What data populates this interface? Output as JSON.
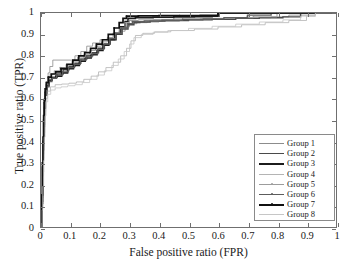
{
  "chart_data": {
    "type": "line",
    "title": "",
    "xlabel": "False positive ratio (FPR)",
    "ylabel": "True positive ratio (TPR)",
    "xlim": [
      0,
      1
    ],
    "ylim": [
      0,
      1
    ],
    "grid": false,
    "legend_position": "lower right",
    "xticks": [
      "0",
      "0.1",
      "0.2",
      "0.3",
      "0.4",
      "0.5",
      "0.6",
      "0.7",
      "0.8",
      "0.9",
      "1"
    ],
    "yticks": [
      "0",
      "0.1",
      "0.2",
      "0.3",
      "0.4",
      "0.5",
      "0.6",
      "0.7",
      "0.8",
      "0.9",
      "1"
    ],
    "xtick_values": [
      0,
      0.1,
      0.2,
      0.3,
      0.4,
      0.5,
      0.6,
      0.7,
      0.8,
      0.9,
      1
    ],
    "ytick_values": [
      0,
      0.1,
      0.2,
      0.3,
      0.4,
      0.5,
      0.6,
      0.7,
      0.8,
      0.9,
      1
    ],
    "series": [
      {
        "name": "Group 1",
        "color": "#8c8c8c",
        "width": 0.8,
        "marker": "none",
        "points": [
          [
            0,
            0
          ],
          [
            0.004,
            0.1
          ],
          [
            0.006,
            0.22
          ],
          [
            0.008,
            0.34
          ],
          [
            0.01,
            0.46
          ],
          [
            0.012,
            0.56
          ],
          [
            0.014,
            0.62
          ],
          [
            0.018,
            0.68
          ],
          [
            0.024,
            0.72
          ],
          [
            0.03,
            0.75
          ],
          [
            0.04,
            0.78
          ],
          [
            0.1,
            0.78
          ],
          [
            0.115,
            0.8
          ],
          [
            0.135,
            0.82
          ],
          [
            0.155,
            0.845
          ],
          [
            0.175,
            0.86
          ],
          [
            0.2,
            0.875
          ],
          [
            0.225,
            0.885
          ],
          [
            0.245,
            0.9
          ],
          [
            0.265,
            0.915
          ],
          [
            0.285,
            0.935
          ],
          [
            0.3,
            0.95
          ],
          [
            0.325,
            0.955
          ],
          [
            0.36,
            0.958
          ],
          [
            0.4,
            0.962
          ],
          [
            0.47,
            0.966
          ],
          [
            0.55,
            0.97
          ],
          [
            0.62,
            0.975
          ],
          [
            0.7,
            0.978
          ],
          [
            0.78,
            0.982
          ],
          [
            0.84,
            0.99
          ],
          [
            0.93,
            0.99
          ],
          [
            0.93,
            1.0
          ],
          [
            1.0,
            1.0
          ]
        ]
      },
      {
        "name": "Group 2",
        "color": "#4a4a4a",
        "width": 1.4,
        "marker": "none",
        "points": [
          [
            0,
            0
          ],
          [
            0.004,
            0.12
          ],
          [
            0.006,
            0.26
          ],
          [
            0.008,
            0.38
          ],
          [
            0.01,
            0.48
          ],
          [
            0.012,
            0.56
          ],
          [
            0.015,
            0.62
          ],
          [
            0.02,
            0.66
          ],
          [
            0.028,
            0.685
          ],
          [
            0.038,
            0.7
          ],
          [
            0.055,
            0.715
          ],
          [
            0.075,
            0.735
          ],
          [
            0.095,
            0.75
          ],
          [
            0.115,
            0.765
          ],
          [
            0.135,
            0.785
          ],
          [
            0.155,
            0.8
          ],
          [
            0.175,
            0.815
          ],
          [
            0.195,
            0.835
          ],
          [
            0.215,
            0.855
          ],
          [
            0.235,
            0.875
          ],
          [
            0.255,
            0.9
          ],
          [
            0.275,
            0.925
          ],
          [
            0.295,
            0.945
          ],
          [
            0.315,
            0.955
          ],
          [
            0.335,
            0.958
          ],
          [
            0.37,
            0.962
          ],
          [
            0.42,
            0.965
          ],
          [
            0.5,
            0.968
          ],
          [
            0.58,
            0.97
          ],
          [
            0.66,
            0.975
          ],
          [
            0.74,
            0.978
          ],
          [
            0.82,
            0.982
          ],
          [
            0.88,
            0.99
          ],
          [
            0.88,
            1.0
          ],
          [
            1.0,
            1.0
          ]
        ]
      },
      {
        "name": "Group 3",
        "color": "#1c1c1c",
        "width": 1.6,
        "marker": "none",
        "points": [
          [
            0,
            0
          ],
          [
            0.003,
            0.14
          ],
          [
            0.005,
            0.28
          ],
          [
            0.007,
            0.4
          ],
          [
            0.009,
            0.5
          ],
          [
            0.011,
            0.58
          ],
          [
            0.014,
            0.63
          ],
          [
            0.019,
            0.665
          ],
          [
            0.026,
            0.685
          ],
          [
            0.036,
            0.695
          ],
          [
            0.05,
            0.705
          ],
          [
            0.07,
            0.72
          ],
          [
            0.09,
            0.74
          ],
          [
            0.11,
            0.755
          ],
          [
            0.13,
            0.775
          ],
          [
            0.15,
            0.79
          ],
          [
            0.17,
            0.805
          ],
          [
            0.19,
            0.825
          ],
          [
            0.21,
            0.85
          ],
          [
            0.23,
            0.875
          ],
          [
            0.25,
            0.905
          ],
          [
            0.268,
            0.935
          ],
          [
            0.285,
            0.96
          ],
          [
            0.295,
            0.975
          ],
          [
            0.32,
            0.978
          ],
          [
            0.38,
            0.98
          ],
          [
            0.45,
            0.982
          ],
          [
            0.52,
            0.983
          ],
          [
            0.58,
            0.985
          ],
          [
            0.6,
            0.99
          ],
          [
            0.6,
            1.0
          ],
          [
            1.0,
            1.0
          ]
        ]
      },
      {
        "name": "Group 4",
        "color": "#b4b4b4",
        "width": 0.8,
        "marker": "none",
        "points": [
          [
            0,
            0
          ],
          [
            0.004,
            0.09
          ],
          [
            0.006,
            0.2
          ],
          [
            0.008,
            0.32
          ],
          [
            0.01,
            0.44
          ],
          [
            0.013,
            0.54
          ],
          [
            0.016,
            0.6
          ],
          [
            0.022,
            0.635
          ],
          [
            0.032,
            0.655
          ],
          [
            0.048,
            0.665
          ],
          [
            0.07,
            0.668
          ],
          [
            0.095,
            0.672
          ],
          [
            0.12,
            0.678
          ],
          [
            0.145,
            0.69
          ],
          [
            0.17,
            0.705
          ],
          [
            0.195,
            0.725
          ],
          [
            0.22,
            0.745
          ],
          [
            0.245,
            0.77
          ],
          [
            0.27,
            0.8
          ],
          [
            0.29,
            0.835
          ],
          [
            0.305,
            0.87
          ],
          [
            0.32,
            0.895
          ],
          [
            0.345,
            0.905
          ],
          [
            0.385,
            0.912
          ],
          [
            0.44,
            0.918
          ],
          [
            0.52,
            0.925
          ],
          [
            0.6,
            0.935
          ],
          [
            0.68,
            0.945
          ],
          [
            0.76,
            0.955
          ],
          [
            0.84,
            0.965
          ],
          [
            0.9,
            0.985
          ],
          [
            0.93,
            0.99
          ],
          [
            0.93,
            1.0
          ],
          [
            1.0,
            1.0
          ]
        ]
      },
      {
        "name": "Group 5",
        "color": "#9c9c9c",
        "width": 1.0,
        "marker": "dot",
        "points": [
          [
            0,
            0
          ],
          [
            0.003,
            0.13
          ],
          [
            0.005,
            0.27
          ],
          [
            0.007,
            0.39
          ],
          [
            0.009,
            0.49
          ],
          [
            0.011,
            0.57
          ],
          [
            0.013,
            0.625
          ],
          [
            0.017,
            0.665
          ],
          [
            0.023,
            0.695
          ],
          [
            0.031,
            0.715
          ],
          [
            0.045,
            0.73
          ],
          [
            0.065,
            0.745
          ],
          [
            0.085,
            0.76
          ],
          [
            0.105,
            0.775
          ],
          [
            0.125,
            0.79
          ],
          [
            0.145,
            0.805
          ],
          [
            0.165,
            0.825
          ],
          [
            0.185,
            0.845
          ],
          [
            0.205,
            0.865
          ],
          [
            0.225,
            0.885
          ],
          [
            0.245,
            0.905
          ],
          [
            0.265,
            0.93
          ],
          [
            0.285,
            0.955
          ],
          [
            0.3,
            0.965
          ],
          [
            0.33,
            0.968
          ],
          [
            0.38,
            0.97
          ],
          [
            0.45,
            0.972
          ],
          [
            0.54,
            0.975
          ],
          [
            0.63,
            0.978
          ],
          [
            0.72,
            0.982
          ],
          [
            0.8,
            0.99
          ],
          [
            0.8,
            1.0
          ],
          [
            1.0,
            1.0
          ]
        ]
      },
      {
        "name": "Group 6",
        "color": "#5c5c5c",
        "width": 1.3,
        "marker": "dot",
        "points": [
          [
            0,
            0
          ],
          [
            0.004,
            0.11
          ],
          [
            0.006,
            0.24
          ],
          [
            0.008,
            0.36
          ],
          [
            0.01,
            0.47
          ],
          [
            0.012,
            0.555
          ],
          [
            0.015,
            0.615
          ],
          [
            0.02,
            0.655
          ],
          [
            0.027,
            0.68
          ],
          [
            0.037,
            0.695
          ],
          [
            0.053,
            0.71
          ],
          [
            0.073,
            0.725
          ],
          [
            0.093,
            0.745
          ],
          [
            0.113,
            0.76
          ],
          [
            0.133,
            0.78
          ],
          [
            0.153,
            0.795
          ],
          [
            0.173,
            0.81
          ],
          [
            0.193,
            0.83
          ],
          [
            0.213,
            0.855
          ],
          [
            0.233,
            0.88
          ],
          [
            0.253,
            0.905
          ],
          [
            0.273,
            0.93
          ],
          [
            0.292,
            0.95
          ],
          [
            0.31,
            0.96
          ],
          [
            0.35,
            0.963
          ],
          [
            0.41,
            0.966
          ],
          [
            0.48,
            0.97
          ],
          [
            0.55,
            0.973
          ],
          [
            0.62,
            0.978
          ],
          [
            0.7,
            0.985
          ],
          [
            0.7,
            0.99
          ],
          [
            0.78,
            0.99
          ],
          [
            0.78,
            1.0
          ],
          [
            1.0,
            1.0
          ]
        ]
      },
      {
        "name": "Group 7",
        "color": "#101010",
        "width": 1.7,
        "marker": "dot",
        "points": [
          [
            0,
            0
          ],
          [
            0.003,
            0.15
          ],
          [
            0.005,
            0.3
          ],
          [
            0.007,
            0.42
          ],
          [
            0.009,
            0.52
          ],
          [
            0.011,
            0.595
          ],
          [
            0.014,
            0.645
          ],
          [
            0.018,
            0.675
          ],
          [
            0.025,
            0.7
          ],
          [
            0.035,
            0.715
          ],
          [
            0.05,
            0.725
          ],
          [
            0.068,
            0.74
          ],
          [
            0.088,
            0.76
          ],
          [
            0.108,
            0.78
          ],
          [
            0.128,
            0.8
          ],
          [
            0.148,
            0.815
          ],
          [
            0.168,
            0.835
          ],
          [
            0.188,
            0.855
          ],
          [
            0.208,
            0.875
          ],
          [
            0.228,
            0.9
          ],
          [
            0.248,
            0.93
          ],
          [
            0.265,
            0.955
          ],
          [
            0.278,
            0.975
          ],
          [
            0.29,
            0.985
          ],
          [
            0.33,
            0.987
          ],
          [
            0.4,
            0.988
          ],
          [
            0.47,
            0.988
          ],
          [
            0.54,
            0.989
          ],
          [
            0.6,
            0.99
          ],
          [
            0.6,
            1.0
          ],
          [
            1.0,
            1.0
          ]
        ]
      },
      {
        "name": "Group 8",
        "color": "#c6c6c6",
        "width": 0.8,
        "marker": "none",
        "points": [
          [
            0,
            0
          ],
          [
            0.004,
            0.08
          ],
          [
            0.006,
            0.19
          ],
          [
            0.009,
            0.31
          ],
          [
            0.011,
            0.42
          ],
          [
            0.014,
            0.52
          ],
          [
            0.017,
            0.585
          ],
          [
            0.023,
            0.62
          ],
          [
            0.033,
            0.64
          ],
          [
            0.048,
            0.65
          ],
          [
            0.068,
            0.655
          ],
          [
            0.09,
            0.66
          ],
          [
            0.115,
            0.665
          ],
          [
            0.14,
            0.675
          ],
          [
            0.165,
            0.69
          ],
          [
            0.19,
            0.71
          ],
          [
            0.215,
            0.73
          ],
          [
            0.24,
            0.755
          ],
          [
            0.262,
            0.785
          ],
          [
            0.282,
            0.82
          ],
          [
            0.3,
            0.855
          ],
          [
            0.315,
            0.885
          ],
          [
            0.34,
            0.9
          ],
          [
            0.38,
            0.91
          ],
          [
            0.43,
            0.918
          ],
          [
            0.5,
            0.928
          ],
          [
            0.58,
            0.938
          ],
          [
            0.66,
            0.948
          ],
          [
            0.74,
            0.958
          ],
          [
            0.82,
            0.968
          ],
          [
            0.88,
            0.985
          ],
          [
            0.93,
            0.99
          ],
          [
            0.93,
            1.0
          ],
          [
            1.0,
            1.0
          ]
        ]
      }
    ]
  },
  "legend": {
    "items": [
      {
        "label": "Group 1"
      },
      {
        "label": "Group 2"
      },
      {
        "label": "Group 3"
      },
      {
        "label": "Group 4"
      },
      {
        "label": "Group 5"
      },
      {
        "label": "Group 6"
      },
      {
        "label": "Group 7"
      },
      {
        "label": "Group 8"
      }
    ]
  },
  "axis_colors": {
    "frame": "#6f6f6f",
    "text": "#1a1a1a",
    "background": "#ffffff"
  }
}
